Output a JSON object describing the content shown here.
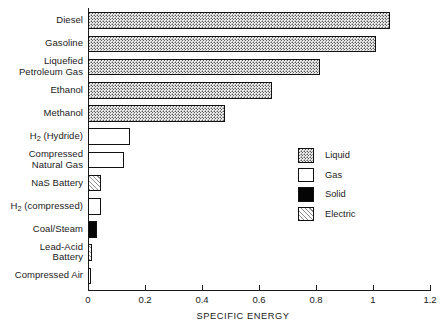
{
  "chart_data": {
    "type": "bar",
    "orientation": "horizontal",
    "title": "",
    "xlabel": "SPECIFIC ENERGY",
    "ylabel": "",
    "xlim": [
      0,
      1.2
    ],
    "xticks": [
      "0",
      "0.2",
      "0.4",
      "0.6",
      "0.8",
      "1",
      "1.2"
    ],
    "xtick_values": [
      0,
      0.2,
      0.4,
      0.6,
      0.8,
      1.0,
      1.2
    ],
    "grid": false,
    "legend_position": "center-right",
    "categories": [
      "Diesel",
      "Gasoline",
      "Liquefied Petroleum Gas",
      "Ethanol",
      "Methanol",
      "H2 (Hydride)",
      "Compressed Natural Gas",
      "NaS Battery",
      "H2 (compressed)",
      "Coal/Steam",
      "Lead-Acid Battery",
      "Compressed Air"
    ],
    "values": [
      1.06,
      1.01,
      0.815,
      0.645,
      0.48,
      0.147,
      0.127,
      0.045,
      0.045,
      0.032,
      0.014,
      0.009
    ],
    "series": [
      {
        "name": "Specific Energy",
        "values": [
          1.06,
          1.01,
          0.815,
          0.645,
          0.48,
          0.147,
          0.127,
          0.045,
          0.045,
          0.032,
          0.014,
          0.009
        ]
      }
    ],
    "bars": [
      {
        "label_lines": [
          "Diesel"
        ],
        "value": 1.06,
        "group": "Liquid"
      },
      {
        "label_lines": [
          "Gasoline"
        ],
        "value": 1.01,
        "group": "Liquid"
      },
      {
        "label_lines": [
          "Liquefied",
          "Petroleum Gas"
        ],
        "value": 0.815,
        "group": "Liquid"
      },
      {
        "label_lines": [
          "Ethanol"
        ],
        "value": 0.645,
        "group": "Liquid"
      },
      {
        "label_lines": [
          "Methanol"
        ],
        "value": 0.48,
        "group": "Liquid"
      },
      {
        "label_html": "H<sub>2</sub> (Hydride)",
        "value": 0.147,
        "group": "Gas"
      },
      {
        "label_lines": [
          "Compressed",
          "Natural Gas"
        ],
        "value": 0.127,
        "group": "Gas"
      },
      {
        "label_lines": [
          "NaS Battery"
        ],
        "value": 0.045,
        "group": "Electric"
      },
      {
        "label_html": "H<sub>2</sub> (compressed)",
        "value": 0.045,
        "group": "Gas"
      },
      {
        "label_lines": [
          "Coal/Steam"
        ],
        "value": 0.032,
        "group": "Solid"
      },
      {
        "label_lines": [
          "Lead-Acid",
          "Battery"
        ],
        "value": 0.014,
        "group": "Electric"
      },
      {
        "label_lines": [
          "Compressed Air"
        ],
        "value": 0.009,
        "group": "Gas"
      }
    ],
    "legend": [
      {
        "label": "Liquid",
        "pattern": "dotted",
        "color": "#e9e9e9"
      },
      {
        "label": "Gas",
        "pattern": "empty",
        "color": "#ffffff"
      },
      {
        "label": "Solid",
        "pattern": "filled",
        "color": "#050505"
      },
      {
        "label": "Electric",
        "pattern": "hatched",
        "color": "#f2f2f2"
      }
    ]
  },
  "colors": {
    "axis": "#1a1a1a",
    "bar_outline": "#111111",
    "background": "#ffffff"
  }
}
